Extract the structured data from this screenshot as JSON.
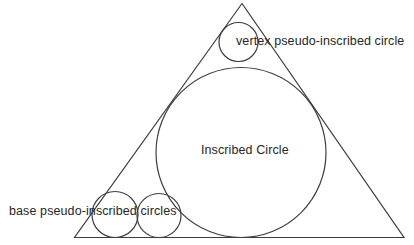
{
  "labels": {
    "vertex": "vertex pseudo-inscribed circle",
    "inscribed": "Inscribed Circle",
    "base": "base pseudo-inscribed circles"
  },
  "colors": {
    "line": "#3d3d3d",
    "text": "#262626",
    "background": "#ffffff"
  },
  "diagram": {
    "triangle": {
      "points": "242,3.5 74.5,237.5 404,237.5"
    },
    "circles": {
      "inscribed": {
        "cx": 241,
        "cy": 152.5,
        "r": 85
      },
      "vertex": {
        "cx": 238.5,
        "cy": 42,
        "r": 19.5
      },
      "base_left": {
        "cx": 115,
        "cy": 214.5,
        "r": 23
      },
      "base_right": {
        "cx": 159,
        "cy": 215.5,
        "r": 22
      }
    }
  }
}
